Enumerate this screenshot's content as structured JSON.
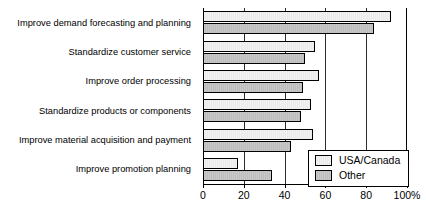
{
  "chart_data": {
    "type": "bar",
    "orientation": "horizontal",
    "title": "",
    "xlabel": "",
    "ylabel": "",
    "xlim": [
      0,
      100
    ],
    "xticks": [
      0,
      20,
      40,
      60,
      80,
      100
    ],
    "xtick_labels": [
      "0",
      "20",
      "40",
      "60",
      "80",
      "100%"
    ],
    "grid": true,
    "legend_position": "lower-right-inside",
    "categories": [
      "Improve demand forecasting and planning",
      "Standardize customer service",
      "Improve order processing",
      "Standardize products or components",
      "Improve material acquisition and payment",
      "Improve promotion planning"
    ],
    "series": [
      {
        "name": "USA/Canada",
        "color": "#efefef",
        "values": [
          92,
          55,
          57,
          53,
          54,
          17
        ]
      },
      {
        "name": "Other",
        "color": "#c4c4c4",
        "values": [
          84,
          50,
          49,
          48,
          43,
          34
        ]
      }
    ]
  },
  "legend": {
    "items": [
      {
        "label": "USA/Canada"
      },
      {
        "label": "Other"
      }
    ]
  }
}
